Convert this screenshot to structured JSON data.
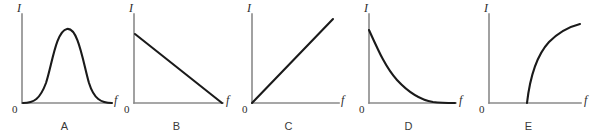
{
  "figure": {
    "type": "diagram",
    "background_color": "#ffffff",
    "axis_color": "#8a8a8a",
    "curve_color": "#1a1a1a",
    "caption_color": "#3a3a3a",
    "y_axis_label": "I",
    "x_axis_label": "f",
    "origin_label": "0"
  },
  "panels": [
    {
      "caption": "A",
      "shape": "bell",
      "y_axis_label": "I",
      "x_axis_label": "f",
      "origin_label": "0",
      "curve_path": "M 7,88 C 18,88 24,84 30,68 C 36,50 40,16 51,14 C 62,12 67,47 73,68 C 78,84 85,88 96,88",
      "description": "symmetric bell-shaped peak rising from zero and returning to zero"
    },
    {
      "caption": "B",
      "shape": "decreasing-line",
      "y_axis_label": "I",
      "x_axis_label": "f",
      "origin_label": "0",
      "curve_path": "M 7,19 L 94,88",
      "description": "straight line decreasing from a positive intercept on the I axis to zero at a finite f"
    },
    {
      "caption": "C",
      "shape": "increasing-line",
      "y_axis_label": "I",
      "x_axis_label": "f",
      "origin_label": "0",
      "curve_path": "M 6,88 L 87,4",
      "description": "straight line increasing linearly from the origin"
    },
    {
      "caption": "D",
      "shape": "exponential-decay",
      "y_axis_label": "I",
      "x_axis_label": "f",
      "origin_label": "0",
      "curve_path": "M 6,15 C 16,37 23,53 34,65 C 46,78 58,85 70,87 C 78,88 85,88 92,88",
      "description": "exponential decay from a maximum on the I axis asymptotically approaching zero"
    },
    {
      "caption": "E",
      "shape": "threshold-rise",
      "y_axis_label": "I",
      "x_axis_label": "f",
      "origin_label": "0",
      "curve_path": "M 44,88 C 47,62 54,40 66,27 C 78,15 89,11 97,9",
      "description": "curve starting at a nonzero threshold frequency and rising with decreasing slope"
    }
  ],
  "layout": {
    "panel_lefts": [
      5,
      117,
      229,
      349,
      469
    ],
    "panel_width": 119,
    "panel_height": 135
  }
}
